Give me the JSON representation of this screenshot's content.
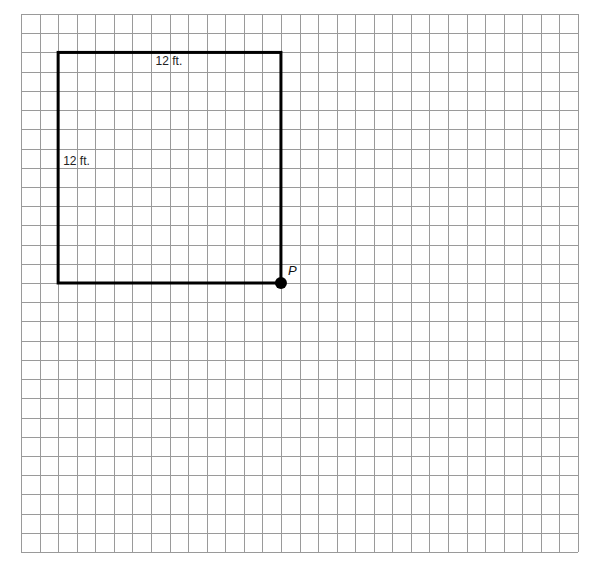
{
  "grid": {
    "columns": 30,
    "rows": 28,
    "left": 21,
    "top": 14,
    "right": 578,
    "bottom": 552,
    "line_color": "#9a9a9a"
  },
  "square": {
    "left_col": 2,
    "top_row": 2,
    "size_cells": 12,
    "stroke_color": "#000000",
    "top_label": "12 ft.",
    "left_label": "12 ft."
  },
  "point": {
    "label": "P",
    "col": 14,
    "row": 14,
    "color": "#000000"
  }
}
